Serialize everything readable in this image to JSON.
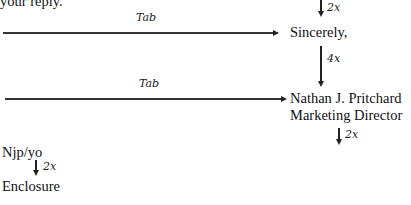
{
  "document": {
    "intro_fragment": "your reply.",
    "tab_annotations": [
      "Tab",
      "Tab"
    ],
    "closing": "Sincerely,",
    "signer_name": "Nathan J. Pritchard",
    "signer_title": "Marketing Director",
    "reference_initials": "Njp/yo",
    "enclosure": "Enclosure",
    "spacing_annotations": {
      "before_closing": "2x",
      "after_closing": "4x",
      "after_title": "2x",
      "after_initials": "2x"
    }
  }
}
